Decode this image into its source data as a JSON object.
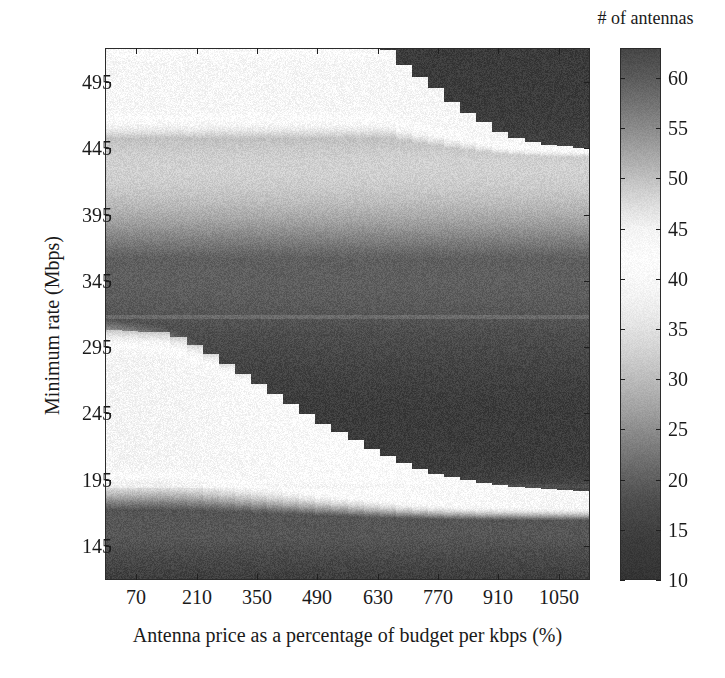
{
  "figure": {
    "width": 725,
    "height": 678,
    "background": "#ffffff",
    "ink_color": "#1a1a1a"
  },
  "chart_data": {
    "type": "heatmap",
    "title": "",
    "xlabel": "Antenna price as a percentage of budget per kbps (%)",
    "ylabel": "Minimum rate (Mbps)",
    "colorbar_label": "# of antennas",
    "colormap": "grayscale-nonmonotonic",
    "grid": false,
    "legend_position": "right-colorbar",
    "xlim": [
      0,
      1120
    ],
    "ylim": [
      120,
      520
    ],
    "xticks": [
      70,
      210,
      350,
      490,
      630,
      770,
      910,
      1050
    ],
    "xticklabels": [
      "70",
      "210",
      "350",
      "490",
      "630",
      "770",
      "910",
      "1050"
    ],
    "yticks": [
      145,
      195,
      245,
      295,
      345,
      395,
      445,
      495
    ],
    "yticklabels": [
      "145",
      "195",
      "245",
      "295",
      "345",
      "395",
      "445",
      "495"
    ],
    "zlim": [
      10,
      63
    ],
    "colorbar_ticks": [
      10,
      15,
      20,
      25,
      30,
      35,
      40,
      45,
      50,
      55,
      60
    ],
    "colorbar_ticklabels": [
      "10",
      "15",
      "20",
      "25",
      "30",
      "35",
      "40",
      "45",
      "50",
      "55",
      "60"
    ],
    "color_stops": [
      {
        "value": 10,
        "gray": 52
      },
      {
        "value": 14,
        "gray": 60
      },
      {
        "value": 18,
        "gray": 78
      },
      {
        "value": 21,
        "gray": 104
      },
      {
        "value": 24,
        "gray": 132
      },
      {
        "value": 27,
        "gray": 162
      },
      {
        "value": 30,
        "gray": 188
      },
      {
        "value": 33,
        "gray": 212
      },
      {
        "value": 36,
        "gray": 232
      },
      {
        "value": 39,
        "gray": 246
      },
      {
        "value": 42,
        "gray": 252
      },
      {
        "value": 45,
        "gray": 244
      },
      {
        "value": 48,
        "gray": 215
      },
      {
        "value": 51,
        "gray": 182
      },
      {
        "value": 54,
        "gray": 150
      },
      {
        "value": 57,
        "gray": 120
      },
      {
        "value": 60,
        "gray": 92
      },
      {
        "value": 63,
        "gray": 70
      }
    ],
    "x_grid_values": [
      70,
      105,
      140,
      175,
      210,
      245,
      280,
      315,
      350,
      385,
      420,
      455,
      490,
      525,
      560,
      595,
      630,
      665,
      700,
      735,
      770,
      805,
      840,
      875,
      910,
      945,
      980,
      1015,
      1050,
      1085
    ],
    "y_grid_values": [
      145,
      155,
      165,
      175,
      185,
      195,
      205,
      215,
      225,
      235,
      245,
      255,
      265,
      275,
      285,
      295,
      305,
      315,
      325,
      335,
      345,
      355,
      365,
      375,
      385,
      395,
      405,
      415,
      425,
      435,
      445,
      455,
      465,
      475,
      485,
      495,
      505,
      515
    ],
    "noise_amplitude": 1.2,
    "regions": [
      {
        "name": "upper-bright-band",
        "y_range": [
          450,
          520
        ],
        "peak_value": 44,
        "staircase": "descending-right",
        "staircase_points": [
          [
            0,
            520
          ],
          [
            650,
            520
          ],
          [
            700,
            505
          ],
          [
            760,
            492
          ],
          [
            810,
            478
          ],
          [
            860,
            468
          ],
          [
            910,
            458
          ],
          [
            960,
            452
          ],
          [
            1010,
            448
          ],
          [
            1120,
            445
          ]
        ]
      },
      {
        "name": "mid-dark-band",
        "y_range": [
          310,
          450
        ],
        "peak_value": 22
      },
      {
        "name": "lower-bright-band",
        "y_range": [
          185,
          308
        ],
        "peak_value": 45,
        "staircase": "descending-right",
        "staircase_points": [
          [
            0,
            308
          ],
          [
            150,
            306
          ],
          [
            210,
            296
          ],
          [
            270,
            284
          ],
          [
            330,
            272
          ],
          [
            390,
            260
          ],
          [
            450,
            248
          ],
          [
            510,
            236
          ],
          [
            570,
            226
          ],
          [
            630,
            216
          ],
          [
            700,
            206
          ],
          [
            780,
            198
          ],
          [
            880,
            192
          ],
          [
            1000,
            188
          ],
          [
            1120,
            186
          ]
        ]
      },
      {
        "name": "bottom-dark-band",
        "y_range": [
          120,
          185
        ],
        "peak_value": 18
      }
    ]
  },
  "axes": {
    "y_tick_label_entries": [
      {
        "label": "495",
        "value": 495
      },
      {
        "label": "445",
        "value": 445
      },
      {
        "label": "395",
        "value": 395
      },
      {
        "label": "345",
        "value": 345
      },
      {
        "label": "295",
        "value": 295
      },
      {
        "label": "245",
        "value": 245
      },
      {
        "label": "195",
        "value": 195
      },
      {
        "label": "145",
        "value": 145
      }
    ],
    "x_tick_label_entries": [
      {
        "label": "70",
        "value": 70
      },
      {
        "label": "210",
        "value": 210
      },
      {
        "label": "350",
        "value": 350
      },
      {
        "label": "490",
        "value": 490
      },
      {
        "label": "630",
        "value": 630
      },
      {
        "label": "770",
        "value": 770
      },
      {
        "label": "910",
        "value": 910
      },
      {
        "label": "1050",
        "value": 1050
      }
    ]
  }
}
